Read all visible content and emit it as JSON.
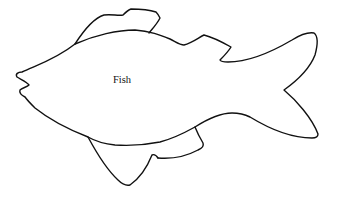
{
  "diagram": {
    "label": "Fish",
    "stroke_color": "#111111",
    "background_color": "#ffffff",
    "parts": [
      "body",
      "dorsal-fin",
      "second-dorsal-fin",
      "tail-fin",
      "pelvic-fin",
      "anal-fin",
      "mouth"
    ]
  }
}
